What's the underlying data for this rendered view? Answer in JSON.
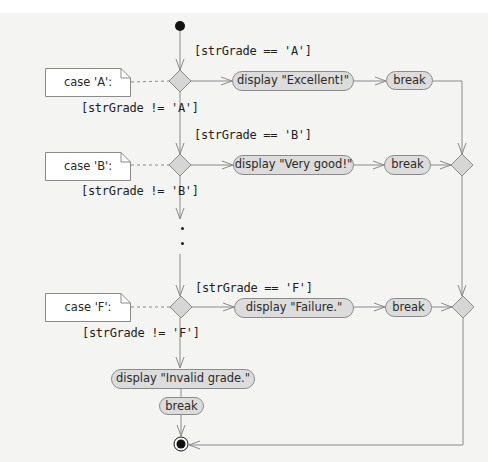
{
  "diagram": {
    "type": "UML activity diagram",
    "colors": {
      "background": "#f4f4f3",
      "node_fill": "#dcdcdc",
      "line": "#8a8a8a",
      "initial_node": "#111111",
      "note_fill": "#ffffff"
    },
    "initial_node": {
      "label": "initial-state"
    },
    "cases": [
      {
        "note": "case 'A':",
        "guard_true": "[strGrade == 'A']",
        "guard_false": "[strGrade != 'A']",
        "action": "display \"Excellent!\"",
        "break": "break"
      },
      {
        "note": "case 'B':",
        "guard_true": "[strGrade == 'B']",
        "guard_false": "[strGrade != 'B']",
        "action": "display \"Very good!\"",
        "break": "break"
      },
      {
        "note": "case 'F':",
        "guard_true": "[strGrade == 'F']",
        "guard_false": "[strGrade != 'F']",
        "action": "display \"Failure.\"",
        "break": "break"
      }
    ],
    "ellipsis": "...",
    "default": {
      "action": "display \"Invalid grade.\"",
      "break": "break"
    },
    "final_node": {
      "label": "final-state"
    }
  }
}
